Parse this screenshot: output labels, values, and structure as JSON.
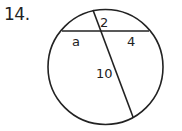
{
  "problem_number": "14.",
  "diagram": {
    "type": "circle-intersecting-chords",
    "labels": {
      "top_segment": "2",
      "left_segment": "a",
      "right_segment": "4",
      "bottom_segment": "10"
    },
    "colors": {
      "stroke": "#222222",
      "background": "#ffffff"
    }
  }
}
